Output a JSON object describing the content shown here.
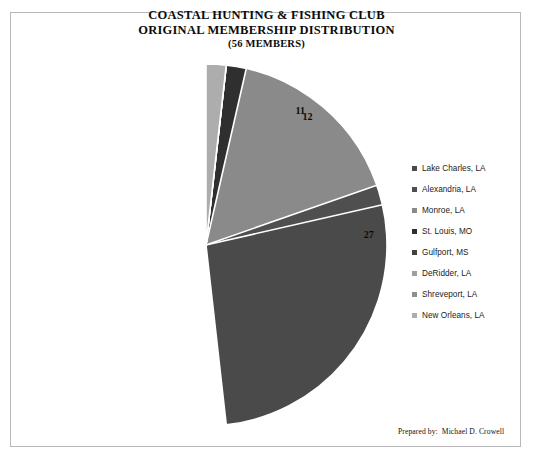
{
  "document": {
    "background_color": "#ffffff",
    "frame_border_color": "#b9b9b9"
  },
  "title": {
    "line1": "COASTAL HUNTING & FISHING CLUB",
    "line2": "ORIGINAL MEMBERSHIP DISTRIBUTION",
    "line3": "(56 MEMBERS)"
  },
  "legend": {
    "position": "right",
    "items": [
      {
        "label": "Lake Charles, LA",
        "color": "#4a4a4a",
        "marker": "square-marker"
      },
      {
        "label": "Alexandria, LA",
        "color": "#4f4f4f",
        "marker": "square-marker"
      },
      {
        "label": "Monroe, LA",
        "color": "#8a8a8a",
        "marker": "square-marker"
      },
      {
        "label": "St. Louis, MO",
        "color": "#2f2f2f",
        "marker": "square-marker"
      },
      {
        "label": "Gulfport, MS",
        "color": "#414141",
        "marker": "square-marker"
      },
      {
        "label": "DeRidder, LA",
        "color": "#9e9e9e",
        "marker": "square-marker"
      },
      {
        "label": "Shreveport, LA",
        "color": "#8f8f8f",
        "marker": "square-marker"
      },
      {
        "label": "New Orleans, LA",
        "color": "#adadad",
        "marker": "square-marker"
      }
    ]
  },
  "footer": {
    "credit": "Prepared by:  Michael D. Crowell"
  },
  "chart_data": {
    "type": "pie",
    "title": "COASTAL HUNTING & FISHING CLUB ORIGINAL MEMBERSHIP DISTRIBUTION (56 MEMBERS)",
    "subtitle": "(56 MEMBERS)",
    "xlabel": "",
    "ylabel": "",
    "total": 56,
    "start_angle_deg": 0,
    "direction": "clockwise",
    "show_value_labels": true,
    "legend_position": "right",
    "categories": [
      "Lake Charles, LA",
      "Alexandria, LA",
      "Monroe, LA",
      "St. Louis, MO",
      "Gulfport, MS",
      "DeRidder, LA",
      "Shreveport, LA",
      "New Orleans, LA"
    ],
    "values": [
      27,
      12,
      11,
      2,
      1,
      1,
      1,
      1
    ],
    "colors": [
      "#4a4a4a",
      "#4f4f4f",
      "#8a8a8a",
      "#2f2f2f",
      "#414141",
      "#9e9e9e",
      "#8f8f8f",
      "#adadad"
    ],
    "slices": [
      {
        "label": "Lake Charles, LA",
        "value": 27,
        "color": "#4a4a4a"
      },
      {
        "label": "Alexandria, LA",
        "value": 12,
        "color": "#4f4f4f"
      },
      {
        "label": "Monroe, LA",
        "value": 11,
        "color": "#8a8a8a"
      },
      {
        "label": "St. Louis, MO",
        "value": 2,
        "color": "#2f2f2f"
      },
      {
        "label": "Gulfport, MS",
        "value": 1,
        "color": "#414141"
      },
      {
        "label": "DeRidder, LA",
        "value": 1,
        "color": "#9e9e9e"
      },
      {
        "label": "Shreveport, LA",
        "value": 1,
        "color": "#8f8f8f"
      },
      {
        "label": "New Orleans, LA",
        "value": 1,
        "color": "#adadad"
      }
    ]
  }
}
